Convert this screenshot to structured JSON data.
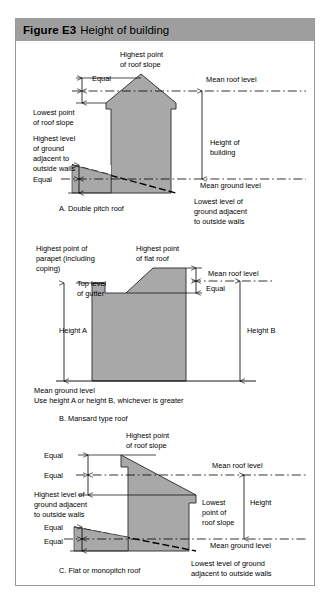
{
  "figure": {
    "number": "Figure E3",
    "title": "Height of building",
    "header_bg": "#9e9e9e",
    "border_color": "#9a9a9a",
    "building_fill": "#a8a8a8",
    "line_color": "#000000"
  },
  "panel_a": {
    "caption": "A. Double pitch roof",
    "labels": {
      "highest_point_line1": "Highest point",
      "highest_point_line2": "of roof slope",
      "equal_top": "Equal",
      "mean_roof_level": "Mean roof level",
      "lowest_point_line1": "Lowest point",
      "lowest_point_line2": "of roof slope",
      "highest_ground_line1": "Highest level",
      "highest_ground_line2": "of ground",
      "highest_ground_line3": "adjacent to",
      "highest_ground_line4": "outside walls",
      "equal_bottom": "Equal",
      "height_line1": "Height of",
      "height_line2": "building",
      "mean_ground_level": "Mean ground level",
      "lowest_ground_line1": "Lowest level of",
      "lowest_ground_line2": "ground adjacent",
      "lowest_ground_line3": "to outside walls"
    }
  },
  "panel_b": {
    "caption": "B. Mansard type roof",
    "labels": {
      "parapet_line1": "Highest point of",
      "parapet_line2": "parapet (including",
      "parapet_line3": "coping)",
      "flat_roof_line1": "Highest point",
      "flat_roof_line2": "of flat roof",
      "mean_roof_level": "Mean roof level",
      "equal": "Equal",
      "gutter_line1": "Top level",
      "gutter_line2": "of gutter",
      "height_a": "Height A",
      "height_b": "Height B",
      "mean_ground_level": "Mean ground level",
      "note": "Use height A or height B, whichever is greater"
    }
  },
  "panel_c": {
    "caption": "C. Flat or monopitch roof",
    "labels": {
      "highest_point_line1": "Highest point",
      "highest_point_line2": "of roof slope",
      "equal_1": "Equal",
      "equal_2": "Equal",
      "mean_roof_level": "Mean roof level",
      "highest_ground_line1": "Highest level of",
      "highest_ground_line2": "ground adjacent",
      "highest_ground_line3": "to outside walls",
      "lowest_point_line1": "Lowest",
      "lowest_point_line2": "point of",
      "lowest_point_line3": "roof slope",
      "height": "Height",
      "equal_3": "Equal",
      "equal_4": "Equal",
      "mean_ground_level": "Mean ground level",
      "lowest_ground_line1": "Lowest level of ground",
      "lowest_ground_line2": "adjacent to outside walls"
    }
  }
}
